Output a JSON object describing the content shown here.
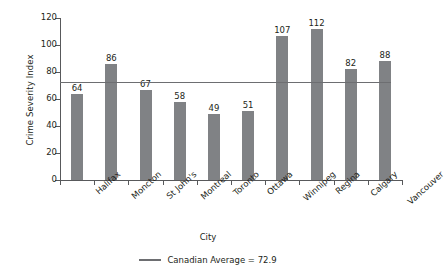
{
  "chart_data": {
    "type": "bar",
    "title": "",
    "xlabel": "City",
    "ylabel": "Crime Severity Index",
    "categories": [
      "Halifax",
      "Moncton",
      "St John's",
      "Montreal",
      "Toronto",
      "Ottawa",
      "Winnipeg",
      "Regina",
      "Calgary",
      "Vancouver"
    ],
    "values": [
      64,
      86,
      67,
      58,
      49,
      51,
      107,
      112,
      82,
      88
    ],
    "ylim": [
      0,
      120
    ],
    "yticks": [
      0,
      20,
      40,
      60,
      80,
      100,
      120
    ],
    "ytick_labels": [
      "0",
      "20",
      "40",
      "60",
      "80",
      "100",
      "120"
    ],
    "grid": false,
    "legend_position": "bottom",
    "reference_line": {
      "label": "Canadian Average = 72.9",
      "value": 72.9
    },
    "series": [
      {
        "name": "Crime Severity Index",
        "values": [
          64,
          86,
          67,
          58,
          49,
          51,
          107,
          112,
          82,
          88
        ]
      }
    ],
    "colors": {
      "bar": "#808285",
      "reference_line": "#6d6e71",
      "axis": "#58595b",
      "text": "#231f20",
      "background": "#ffffff"
    }
  }
}
